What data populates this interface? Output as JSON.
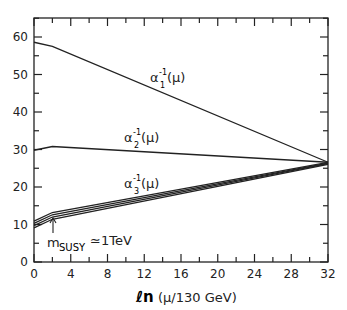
{
  "chart_data": {
    "type": "line",
    "title": "",
    "xlabel": "ln(μ/130 GeV)",
    "ylabel": "",
    "xlim": [
      0,
      32
    ],
    "ylim": [
      0,
      65
    ],
    "x_ticks": [
      "0",
      "4",
      "8",
      "12",
      "16",
      "20",
      "24",
      "28",
      "32"
    ],
    "y_ticks": [
      "0",
      "10",
      "20",
      "30",
      "40",
      "50",
      "60"
    ],
    "series": [
      {
        "name": "α1^-1(μ)",
        "x": [
          0,
          2,
          32
        ],
        "values": [
          58.6,
          57.5,
          26.6
        ]
      },
      {
        "name": "α2^-1(μ)",
        "x": [
          0,
          2,
          32
        ],
        "values": [
          29.8,
          30.8,
          26.6
        ]
      },
      {
        "name": "α3^-1(μ) (band)",
        "x": [
          0,
          2,
          32
        ],
        "values": [
          10.0,
          12.3,
          26.3
        ]
      }
    ],
    "annotations": [
      "m_SUSY ≃ 1TeV (arrow at x=2)"
    ],
    "grid": false
  },
  "labels": {
    "a1": "α",
    "a2": "α",
    "a3": "α",
    "sup": "-1",
    "mu": "(μ)",
    "s1": "1",
    "s2": "2",
    "s3": "3",
    "msusy_m": "m",
    "msusy_sub": "SUSY",
    "msusy_rest": "≃1TeV",
    "xlabel_ln": "ℓn",
    "xlabel_rest": "(μ/130 GeV)"
  }
}
